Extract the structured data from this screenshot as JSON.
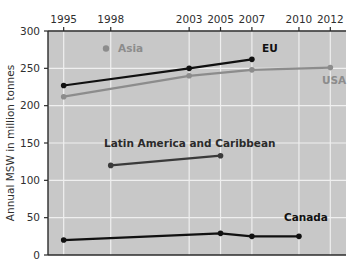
{
  "chart_data": {
    "type": "line",
    "title": "",
    "subtitle": "",
    "xlabel": "",
    "ylabel": "Annual MSW in million tonnes",
    "xlim": [
      1994,
      2013
    ],
    "ylim": [
      0,
      300
    ],
    "grid": true,
    "legend_position": "inline-labels",
    "x_ticks": [
      1995,
      1998,
      2003,
      2005,
      2007,
      2010,
      2012
    ],
    "x_tick_labels": [
      "1995",
      "1998",
      "2003",
      "2005",
      "2007",
      "2010",
      "2012"
    ],
    "y_ticks": [
      0,
      50,
      100,
      150,
      200,
      250,
      300
    ],
    "y_tick_labels": [
      "0",
      "50",
      "100",
      "150",
      "200",
      "250",
      "300"
    ],
    "series": [
      {
        "name": "EU",
        "color": "#111111",
        "label_style": "bold",
        "x": [
          1995,
          2003,
          2007
        ],
        "values": [
          227,
          250,
          262
        ]
      },
      {
        "name": "USA",
        "color": "#8c8c8c",
        "label_style": "gray",
        "x": [
          1995,
          2003,
          2007,
          2012
        ],
        "values": [
          212,
          240,
          248,
          251
        ]
      },
      {
        "name": "Latin America and Caribbean",
        "color": "#3a3a3a",
        "label_style": "dark",
        "x": [
          1998,
          2005
        ],
        "values": [
          120,
          133
        ]
      },
      {
        "name": "Canada",
        "color": "#111111",
        "label_style": "bold",
        "x": [
          1995,
          2005,
          2007,
          2010
        ],
        "values": [
          20,
          29,
          25,
          25
        ]
      },
      {
        "name": "Asia",
        "color": "#8c8c8c",
        "label_style": "gray",
        "x": [],
        "values": []
      }
    ],
    "annotations": [
      {
        "text": "Asia",
        "x_px": 118,
        "y_px": 52,
        "style": "gray",
        "marker": true
      },
      {
        "text": "EU",
        "x_px": 262,
        "y_px": 52,
        "style": "bold",
        "marker": false
      },
      {
        "text": "USA",
        "x_px": 322,
        "y_px": 84,
        "style": "gray",
        "marker": false
      },
      {
        "text": "Latin America and Caribbean",
        "x_px": 104,
        "y_px": 147,
        "style": "dark",
        "marker": false
      },
      {
        "text": "Canada",
        "x_px": 284,
        "y_px": 221,
        "style": "bold",
        "marker": false
      }
    ],
    "colors": {
      "plot_background": "#c8c8c8",
      "gridline": "#efefef",
      "axis": "#2b2b2b",
      "dark_series": "#111111",
      "gray_series": "#8c8c8c",
      "page_background": "#ffffff"
    }
  }
}
